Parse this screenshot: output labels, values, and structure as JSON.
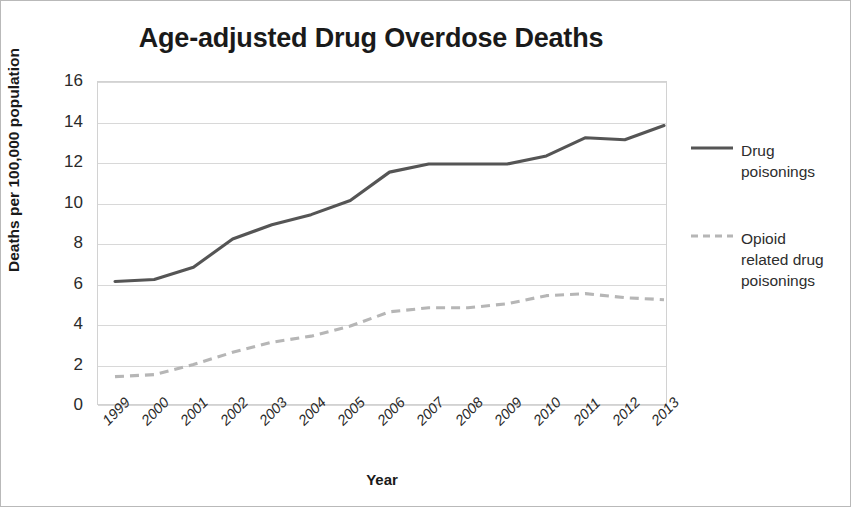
{
  "chart_data": {
    "type": "line",
    "title": "Age-adjusted Drug Overdose Deaths",
    "xlabel": "Year",
    "ylabel": "Deaths per 100,000 population",
    "categories": [
      "1999",
      "2000",
      "2001",
      "2002",
      "2003",
      "2004",
      "2005",
      "2006",
      "2007",
      "2008",
      "2009",
      "2010",
      "2011",
      "2012",
      "2013"
    ],
    "ylim": [
      0,
      16
    ],
    "yticks": [
      0,
      2,
      4,
      6,
      8,
      10,
      12,
      14,
      16
    ],
    "grid": true,
    "legend_position": "right",
    "series": [
      {
        "name": "Drug poisonings",
        "style": "solid",
        "color": "#555555",
        "values": [
          6.1,
          6.2,
          6.8,
          8.2,
          8.9,
          9.4,
          10.1,
          11.5,
          11.9,
          11.9,
          11.9,
          12.3,
          13.2,
          13.1,
          13.8
        ]
      },
      {
        "name": "Opioid related drug poisonings",
        "style": "dashed",
        "color": "#b6b6b6",
        "values": [
          1.4,
          1.5,
          2.0,
          2.6,
          3.1,
          3.4,
          3.9,
          4.6,
          4.8,
          4.8,
          5.0,
          5.4,
          5.5,
          5.3,
          5.2
        ]
      }
    ]
  },
  "title": "Age-adjusted Drug Overdose Deaths",
  "axes": {
    "y_title": "Deaths per 100,000 population",
    "x_title": "Year",
    "y_ticks": [
      "16",
      "14",
      "12",
      "10",
      "8",
      "6",
      "4",
      "2",
      "0"
    ],
    "x_ticks": [
      "1999",
      "2000",
      "2001",
      "2002",
      "2003",
      "2004",
      "2005",
      "2006",
      "2007",
      "2008",
      "2009",
      "2010",
      "2011",
      "2012",
      "2013"
    ]
  },
  "legend": {
    "items": [
      {
        "label": "Drug poisonings",
        "color": "#555555",
        "style": "solid"
      },
      {
        "label": "Opioid related drug poisonings",
        "color": "#b6b6b6",
        "style": "dashed"
      }
    ]
  }
}
